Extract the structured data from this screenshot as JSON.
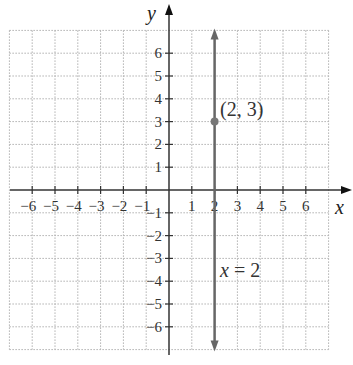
{
  "chart_data": {
    "type": "line",
    "title": "",
    "xlabel": "x",
    "ylabel": "y",
    "xlim": [
      -7,
      7
    ],
    "ylim": [
      -7,
      7
    ],
    "grid": true,
    "x_ticks": [
      -6,
      -5,
      -4,
      -3,
      -2,
      -1,
      1,
      2,
      3,
      4,
      5,
      6
    ],
    "y_ticks": [
      -6,
      -5,
      -4,
      -3,
      -2,
      -1,
      1,
      2,
      3,
      4,
      5,
      6
    ],
    "x_tick_labels": [
      "−6",
      "−5",
      "−4",
      "−3",
      "−2",
      "−1",
      "1",
      "2",
      "3",
      "4",
      "5",
      "6"
    ],
    "y_tick_labels": [
      "−6",
      "−5",
      "−4",
      "−3",
      "−2",
      "−1",
      "1",
      "2",
      "3",
      "4",
      "5",
      "6"
    ],
    "series": [
      {
        "name": "x = 2",
        "type": "vertical-line",
        "x": 2,
        "y_range": [
          -7,
          7
        ],
        "color": "#666666"
      }
    ],
    "points": [
      {
        "x": 2,
        "y": 3,
        "label": "(2, 3)",
        "color": "#777777"
      }
    ],
    "annotations": [
      {
        "text": "(2, 3)",
        "x": 2.2,
        "y": 3.6
      },
      {
        "text": "x = 2",
        "x": 2.25,
        "y": -3.6
      }
    ]
  },
  "labels": {
    "x_axis": "x",
    "y_axis": "y",
    "point": "(2, 3)",
    "line_eq_var": "x",
    "line_eq_rest": " = 2"
  },
  "colors": {
    "axis": "#333333",
    "grid": "#b0b0b0",
    "line": "#666666",
    "point": "#777777"
  }
}
